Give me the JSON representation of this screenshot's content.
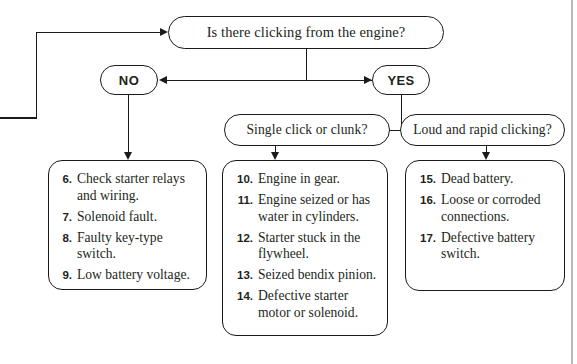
{
  "diagram": {
    "title_node": {
      "label": "Is there clicking from the engine?"
    },
    "branches": {
      "no_label": "NO",
      "yes_label": "YES"
    },
    "sub_questions": {
      "single": "Single click or clunk?",
      "loud": "Loud and rapid clicking?"
    },
    "lists": {
      "no_causes": [
        {
          "num": "6.",
          "text": "Check starter relays and wiring."
        },
        {
          "num": "7.",
          "text": "Solenoid fault."
        },
        {
          "num": "8.",
          "text": "Faulty key-type switch."
        },
        {
          "num": "9.",
          "text": "Low battery voltage."
        }
      ],
      "single_click_causes": [
        {
          "num": "10.",
          "text": "Engine in gear."
        },
        {
          "num": "11.",
          "text": "Engine seized or has water in cylinders."
        },
        {
          "num": "12.",
          "text": "Starter stuck in the flywheel."
        },
        {
          "num": "13.",
          "text": "Seized bendix pinion."
        },
        {
          "num": "14.",
          "text": "Defective starter motor or solenoid."
        }
      ],
      "loud_clicking_causes": [
        {
          "num": "15.",
          "text": "Dead battery."
        },
        {
          "num": "16.",
          "text": "Loose or corroded connections."
        },
        {
          "num": "17.",
          "text": "Defective battery switch."
        }
      ]
    },
    "colors": {
      "stroke": "#1a1a1a",
      "text": "#231f20",
      "background": "#ffffff",
      "page_rule": "#b9b9b9"
    }
  }
}
